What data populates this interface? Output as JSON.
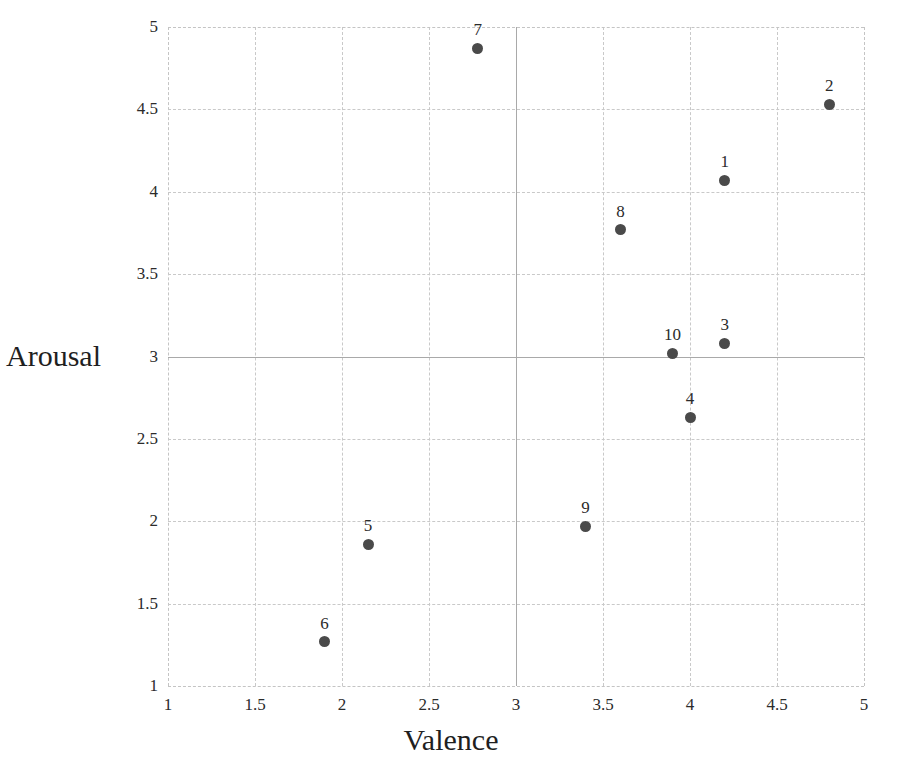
{
  "chart_data": {
    "type": "scatter",
    "title": "",
    "xlabel": "Valence",
    "ylabel": "Arousal",
    "xlim": [
      1,
      5
    ],
    "ylim": [
      1,
      5
    ],
    "xticks": [
      "1",
      "1.5",
      "2",
      "2.5",
      "3",
      "3.5",
      "4",
      "4.5",
      "5"
    ],
    "xtick_values": [
      1,
      1.5,
      2,
      2.5,
      3,
      3.5,
      4,
      4.5,
      5
    ],
    "yticks": [
      "1",
      "1.5",
      "2",
      "2.5",
      "3",
      "3.5",
      "4",
      "4.5",
      "5"
    ],
    "ytick_values": [
      1,
      1.5,
      2,
      2.5,
      3,
      3.5,
      4,
      4.5,
      5
    ],
    "grid": true,
    "grid_style": "dashed",
    "legend": "none",
    "reference_lines": {
      "vertical_x": 3,
      "horizontal_y": 3,
      "color": "#a9a9a9"
    },
    "marker_color": "#4a4a4a",
    "points": [
      {
        "label": "1",
        "x": 4.2,
        "y": 4.07
      },
      {
        "label": "2",
        "x": 4.8,
        "y": 4.53
      },
      {
        "label": "3",
        "x": 4.2,
        "y": 3.08
      },
      {
        "label": "4",
        "x": 4.0,
        "y": 2.63
      },
      {
        "label": "5",
        "x": 2.15,
        "y": 1.86
      },
      {
        "label": "6",
        "x": 1.9,
        "y": 1.27
      },
      {
        "label": "7",
        "x": 2.78,
        "y": 4.87
      },
      {
        "label": "8",
        "x": 3.6,
        "y": 3.77
      },
      {
        "label": "9",
        "x": 3.4,
        "y": 1.97
      },
      {
        "label": "10",
        "x": 3.9,
        "y": 3.02
      }
    ]
  }
}
